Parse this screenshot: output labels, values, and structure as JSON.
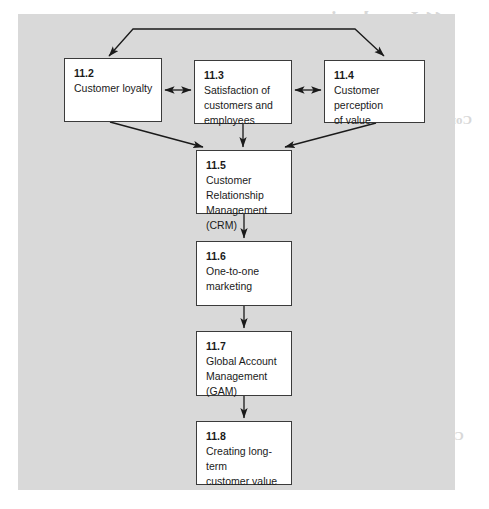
{
  "diagram": {
    "type": "flowchart",
    "panel_background": "#d9d9d9",
    "node_border_color": "#3b3b3b",
    "nodes": [
      {
        "id": "11.2",
        "label": "Customer loyalty"
      },
      {
        "id": "11.3",
        "label": "Satisfaction of\ncustomers and\nemployees"
      },
      {
        "id": "11.4",
        "label": "Customer perception\nof value"
      },
      {
        "id": "11.5",
        "label": "Customer\nRelationship\nManagement (CRM)"
      },
      {
        "id": "11.6",
        "label": "One-to-one\nmarketing"
      },
      {
        "id": "11.7",
        "label": "Global Account\nManagement\n(GAM)"
      },
      {
        "id": "11.8",
        "label": "Creating long-term\ncustomer value"
      }
    ],
    "connectors": [
      {
        "from": "top-bracket",
        "to": "11.2",
        "style": "single-arrow"
      },
      {
        "from": "top-bracket",
        "to": "11.4",
        "style": "single-arrow"
      },
      {
        "from": "11.2",
        "to": "11.3",
        "style": "double-arrow"
      },
      {
        "from": "11.3",
        "to": "11.4",
        "style": "double-arrow"
      },
      {
        "from": "11.2",
        "to": "11.5",
        "style": "single-arrow"
      },
      {
        "from": "11.3",
        "to": "11.5",
        "style": "single-arrow"
      },
      {
        "from": "11.4",
        "to": "11.5",
        "style": "single-arrow"
      },
      {
        "from": "11.5",
        "to": "11.6",
        "style": "single-arrow"
      },
      {
        "from": "11.6",
        "to": "11.7",
        "style": "single-arrow"
      },
      {
        "from": "11.7",
        "to": "11.8",
        "style": "single-arrow"
      }
    ]
  },
  "bleed_through": {
    "title": "11 Introduction",
    "heading": "Concep",
    "subheading": "Concluding this chapter",
    "lines": [
      "the customer value",
      "relationship between",
      "value and loyalty are",
      "customer value and",
      "long-term customer"
    ]
  }
}
